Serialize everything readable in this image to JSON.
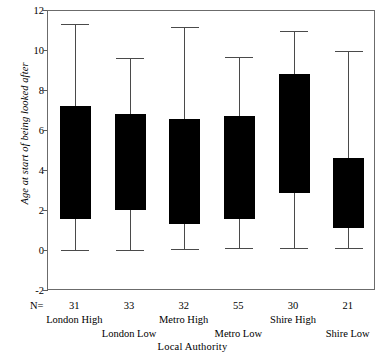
{
  "chart_data": {
    "type": "box",
    "title": "",
    "xlabel": "Local Authority",
    "ylabel": "Age at start of being looked after",
    "ylim": [
      -2,
      12
    ],
    "yticks": [
      12,
      10,
      8,
      6,
      4,
      2,
      0,
      -2
    ],
    "ytick_labels": [
      "12",
      "10",
      "8",
      "6",
      "4",
      "2",
      "0",
      "-2"
    ],
    "grid": false,
    "legend": "none",
    "n_prefix": "N=",
    "categories": [
      "London High",
      "London Low",
      "Metro High",
      "Metro Low",
      "Shire High",
      "Shire Low"
    ],
    "n_values": [
      31,
      33,
      32,
      55,
      30,
      21
    ],
    "boxes": [
      {
        "label": "London High",
        "n": 31,
        "whisker_low": 0.05,
        "q1": 1.6,
        "q3": 7.25,
        "whisker_high": 11.35
      },
      {
        "label": "London Low",
        "n": 33,
        "whisker_low": 0.05,
        "q1": 2.05,
        "q3": 6.85,
        "whisker_high": 9.65
      },
      {
        "label": "Metro High",
        "n": 32,
        "whisker_low": 0.1,
        "q1": 1.35,
        "q3": 6.6,
        "whisker_high": 11.2
      },
      {
        "label": "Metro Low",
        "n": 55,
        "whisker_low": 0.15,
        "q1": 1.6,
        "q3": 6.75,
        "whisker_high": 9.7
      },
      {
        "label": "Shire High",
        "n": 30,
        "whisker_low": 0.15,
        "q1": 2.9,
        "q3": 8.85,
        "whisker_high": 11.0
      },
      {
        "label": "Shire Low",
        "n": 21,
        "whisker_low": 0.15,
        "q1": 1.15,
        "q3": 4.65,
        "whisker_high": 10.0
      }
    ],
    "colors": {
      "box_fill": "#000000",
      "whisker": "#4a4a4a",
      "frame": "#6b6b6b",
      "background": "#ffffff",
      "text": "#000000"
    }
  }
}
